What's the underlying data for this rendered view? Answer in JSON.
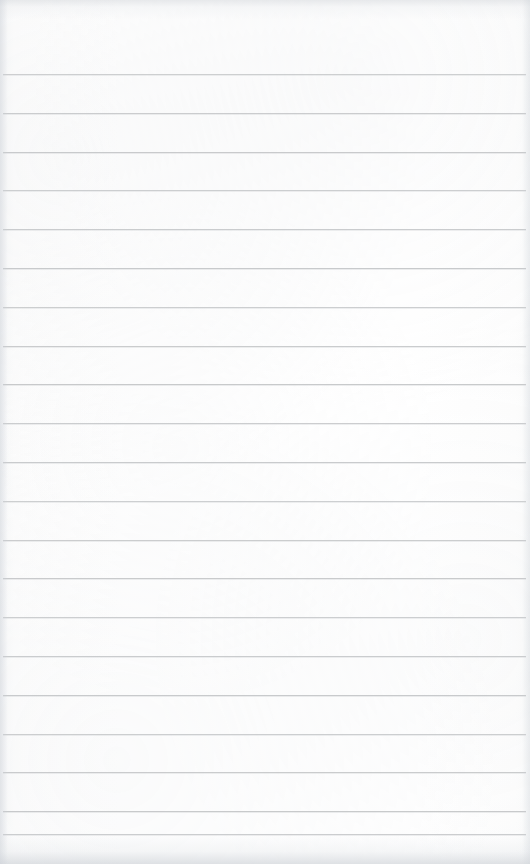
{
  "document": {
    "kind": "scanned-lined-paper",
    "title": "Blank ruled notebook page",
    "width": 530,
    "height": 864,
    "content_text": "",
    "is_blank": true
  },
  "paper": {
    "background_color": "#fdfdfd",
    "edge_tint_color": "#d6d9dd",
    "texture": "faint scanner mottling"
  },
  "ruling": {
    "line_color": "#c6c8ca",
    "line_thickness_px": 1,
    "line_pitch_px": 38.8,
    "first_line_y_px": 74,
    "last_line_y_px": 834,
    "line_count": 21,
    "line_start_x_px": 3,
    "line_end_x_px": 526,
    "header_space_height_px": 74,
    "margin_rule": "none",
    "line_y_positions": [
      74,
      112.8,
      151.6,
      190.4,
      229.2,
      268,
      306.8,
      345.6,
      384.4,
      423.2,
      462,
      500.8,
      539.6,
      578.4,
      617.2,
      656,
      694.8,
      733.6,
      772.4,
      811.2,
      834
    ]
  }
}
